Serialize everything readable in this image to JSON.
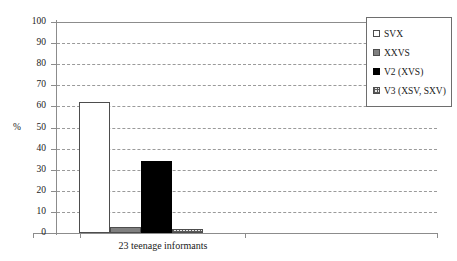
{
  "chart_data": {
    "type": "bar",
    "title": "",
    "subtitle": "",
    "xlabel": "",
    "ylabel": "%",
    "categories": [
      "23 teenage informants"
    ],
    "series": [
      {
        "name": "SVX",
        "values": [
          62
        ],
        "color": "#ffffff",
        "swatch": "sw-white"
      },
      {
        "name": "XXVS",
        "values": [
          3
        ],
        "color": "#808080",
        "swatch": "sw-gray"
      },
      {
        "name": "V2 (XVS)",
        "values": [
          34
        ],
        "color": "#000000",
        "swatch": "sw-black"
      },
      {
        "name": "V3 (XSV, SXV)",
        "values": [
          2
        ],
        "color": "#e8e8e8",
        "swatch": "sw-hatch"
      }
    ],
    "ylim": [
      0,
      100
    ],
    "yticks": [
      0,
      10,
      20,
      30,
      40,
      50,
      60,
      70,
      80,
      90,
      100
    ],
    "grid": "horizontal-dashed",
    "legend_position": "top-right"
  },
  "legend": {
    "items": [
      {
        "label": "SVX"
      },
      {
        "label": "XXVS"
      },
      {
        "label": "V2 (XVS)"
      },
      {
        "label": "V3 (XSV, SXV)"
      }
    ]
  },
  "axis": {
    "y_unit_label": "%",
    "tick_labels": [
      "100",
      "90",
      "80",
      "70",
      "60",
      "50",
      "40",
      "30",
      "20",
      "10",
      "0"
    ],
    "category_label": "23 teenage informants"
  }
}
